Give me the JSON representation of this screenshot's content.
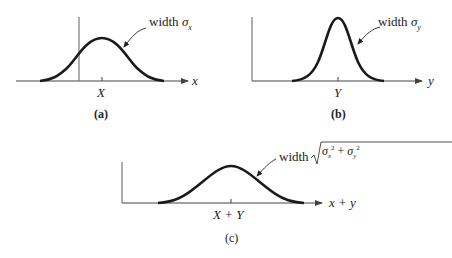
{
  "panels": [
    {
      "id": "a",
      "caption": "(a)",
      "width_label": "width",
      "sigma": "σ",
      "sigma_sub": "x",
      "axis_label": "x",
      "center_label": "X"
    },
    {
      "id": "b",
      "caption": "(b)",
      "width_label": "width",
      "sigma": "σ",
      "sigma_sub": "y",
      "axis_label": "y",
      "center_label": "Y"
    },
    {
      "id": "c",
      "caption": "(c)",
      "width_label": "width",
      "sigma": "σ",
      "sigma_sub_1": "x",
      "sigma_sub_2": "y",
      "sup": "2",
      "plus": "+",
      "axis_label": "x + y",
      "center_label": "X + Y"
    }
  ],
  "colors": {
    "curve": "#1a1a1a",
    "axis": "#444444",
    "vline": "#777777"
  }
}
